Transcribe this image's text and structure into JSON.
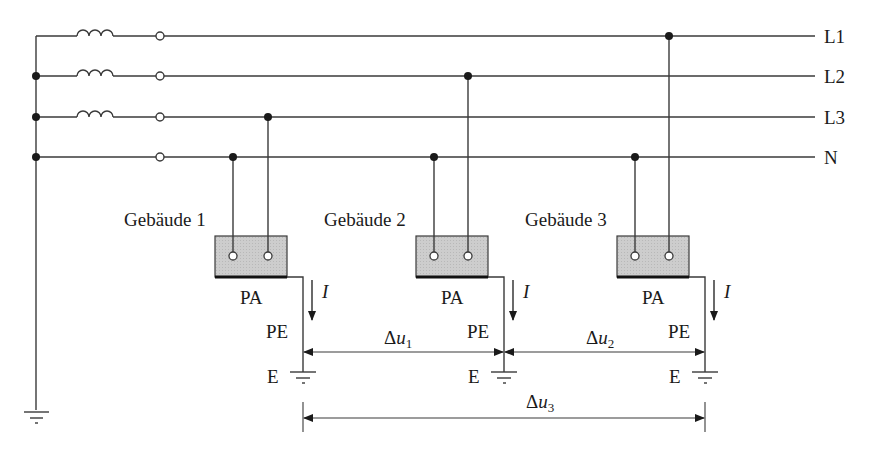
{
  "diagram": {
    "type": "electrical-schematic",
    "conductors": [
      {
        "id": "L1",
        "label": "L1",
        "y": 36
      },
      {
        "id": "L2",
        "label": "L2",
        "y": 76
      },
      {
        "id": "L3",
        "label": "L3",
        "y": 117
      },
      {
        "id": "N",
        "label": "N",
        "y": 157
      }
    ],
    "buildings": [
      {
        "label": "Gebäude 1",
        "pa_label": "PA",
        "pe_label": "PE",
        "earth_label": "E",
        "current_label": "I",
        "connected_phase": "L3"
      },
      {
        "label": "Gebäude 2",
        "pa_label": "PA",
        "pe_label": "PE",
        "earth_label": "E",
        "current_label": "I",
        "connected_phase": "L2"
      },
      {
        "label": "Gebäude 3",
        "pa_label": "PA",
        "pe_label": "PE",
        "earth_label": "E",
        "current_label": "I",
        "connected_phase": "L1"
      }
    ],
    "voltage_drops": [
      {
        "symbol": "Δu",
        "sub": "1",
        "from": "Gebäude 1",
        "to": "Gebäude 2"
      },
      {
        "symbol": "Δu",
        "sub": "2",
        "from": "Gebäude 2",
        "to": "Gebäude 3"
      },
      {
        "symbol": "Δu",
        "sub": "3",
        "from": "Gebäude 1",
        "to": "Gebäude 3"
      }
    ],
    "colors": {
      "line": "#3a3a3a",
      "box_fill": "#cfcfcf",
      "text": "#1a1a1a"
    }
  }
}
